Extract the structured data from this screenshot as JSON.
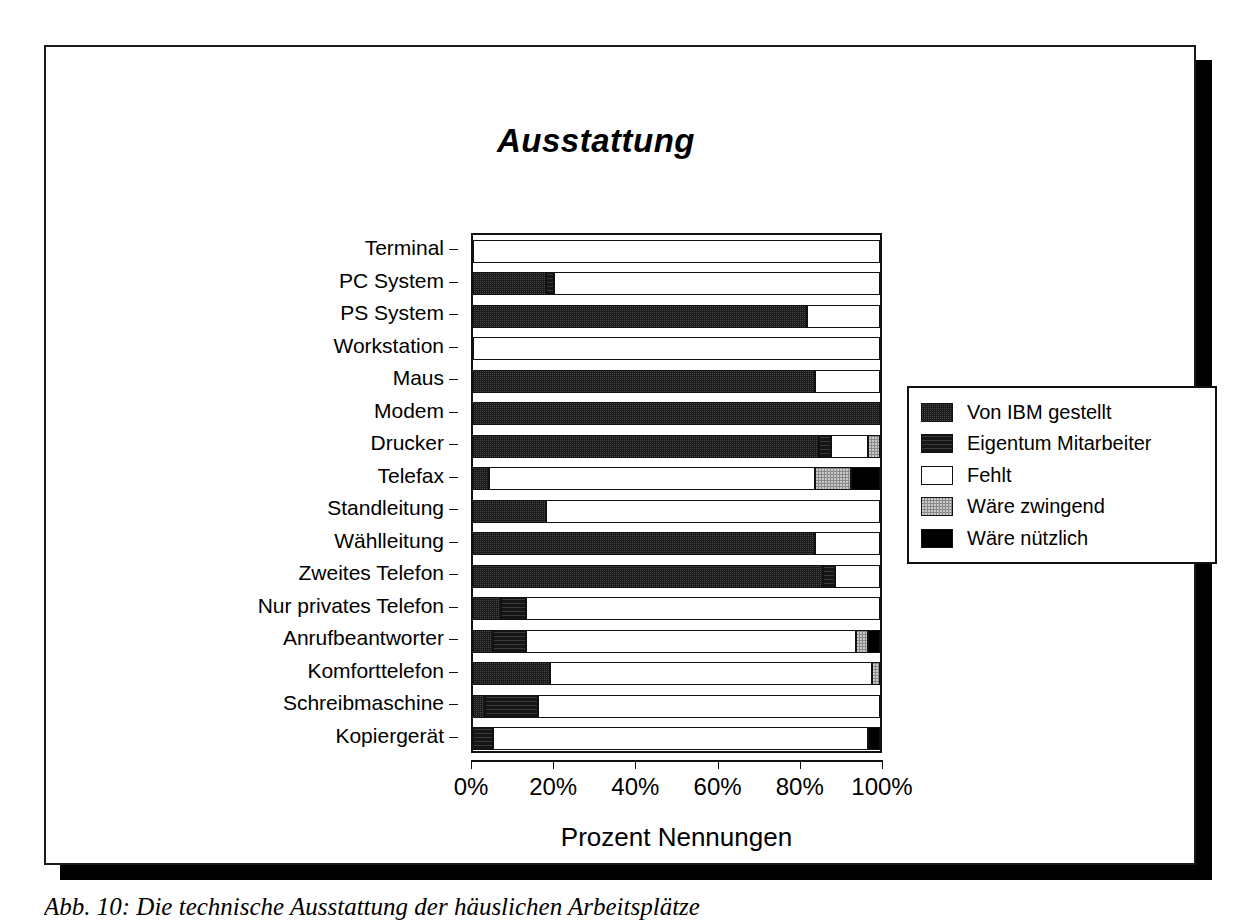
{
  "figure": {
    "caption": "Abb. 10:  Die technische Ausstattung der häuslichen Arbeitsplätze"
  },
  "chart_data": {
    "type": "bar",
    "orientation": "horizontal",
    "stacked": true,
    "title": "Ausstattung",
    "xlabel": "Prozent Nennungen",
    "ylabel": "",
    "xlim": [
      0,
      100
    ],
    "xticks": [
      "0%",
      "20%",
      "40%",
      "60%",
      "80%",
      "100%"
    ],
    "xtick_values": [
      0,
      20,
      40,
      60,
      80,
      100
    ],
    "grid": false,
    "legend_position": "right",
    "series": [
      {
        "name": "Von IBM gestellt",
        "key": "ibm",
        "fill": "dark-crosshatch",
        "color": "#3d3d3d"
      },
      {
        "name": "Eigentum Mitarbeiter",
        "key": "eigentum",
        "fill": "dark-solid",
        "color": "#151515"
      },
      {
        "name": "Fehlt",
        "key": "fehlt",
        "fill": "white",
        "color": "#ffffff"
      },
      {
        "name": "Wäre zwingend",
        "key": "zwingend",
        "fill": "light-dots",
        "color": "#c9c9c9"
      },
      {
        "name": "Wäre nützlich",
        "key": "nuetzlich",
        "fill": "black",
        "color": "#000000"
      }
    ],
    "categories": [
      "Terminal",
      "PC System",
      "PS System",
      "Workstation",
      "Maus",
      "Modem",
      "Drucker",
      "Telefax",
      "Standleitung",
      "Wählleitung",
      "Zweites Telefon",
      "Nur privates Telefon",
      "Anrufbeantworter",
      "Komforttelefon",
      "Schreibmaschine",
      "Kopiergerät"
    ],
    "rows": [
      {
        "category": "Terminal",
        "ibm": 0,
        "eigentum": 0,
        "fehlt": 100,
        "zwingend": 0,
        "nuetzlich": 0
      },
      {
        "category": "PC System",
        "ibm": 18,
        "eigentum": 2,
        "fehlt": 80,
        "zwingend": 0,
        "nuetzlich": 0
      },
      {
        "category": "PS System",
        "ibm": 82,
        "eigentum": 0,
        "fehlt": 18,
        "zwingend": 0,
        "nuetzlich": 0
      },
      {
        "category": "Workstation",
        "ibm": 0,
        "eigentum": 0,
        "fehlt": 100,
        "zwingend": 0,
        "nuetzlich": 0
      },
      {
        "category": "Maus",
        "ibm": 84,
        "eigentum": 0,
        "fehlt": 16,
        "zwingend": 0,
        "nuetzlich": 0
      },
      {
        "category": "Modem",
        "ibm": 100,
        "eigentum": 0,
        "fehlt": 0,
        "zwingend": 0,
        "nuetzlich": 0
      },
      {
        "category": "Drucker",
        "ibm": 85,
        "eigentum": 3,
        "fehlt": 9,
        "zwingend": 3,
        "nuetzlich": 0
      },
      {
        "category": "Telefax",
        "ibm": 4,
        "eigentum": 0,
        "fehlt": 80,
        "zwingend": 9,
        "nuetzlich": 7
      },
      {
        "category": "Standleitung",
        "ibm": 18,
        "eigentum": 0,
        "fehlt": 82,
        "zwingend": 0,
        "nuetzlich": 0
      },
      {
        "category": "Wählleitung",
        "ibm": 84,
        "eigentum": 0,
        "fehlt": 16,
        "zwingend": 0,
        "nuetzlich": 0
      },
      {
        "category": "Zweites Telefon",
        "ibm": 86,
        "eigentum": 3,
        "fehlt": 11,
        "zwingend": 0,
        "nuetzlich": 0
      },
      {
        "category": "Nur privates Telefon",
        "ibm": 7,
        "eigentum": 6,
        "fehlt": 87,
        "zwingend": 0,
        "nuetzlich": 0
      },
      {
        "category": "Anrufbeantworter",
        "ibm": 5,
        "eigentum": 8,
        "fehlt": 81,
        "zwingend": 3,
        "nuetzlich": 3
      },
      {
        "category": "Komforttelefon",
        "ibm": 19,
        "eigentum": 0,
        "fehlt": 79,
        "zwingend": 2,
        "nuetzlich": 0
      },
      {
        "category": "Schreibmaschine",
        "ibm": 3,
        "eigentum": 13,
        "fehlt": 84,
        "zwingend": 0,
        "nuetzlich": 0
      },
      {
        "category": "Kopiergerät",
        "ibm": 0,
        "eigentum": 5,
        "fehlt": 92,
        "zwingend": 0,
        "nuetzlich": 3
      }
    ]
  }
}
